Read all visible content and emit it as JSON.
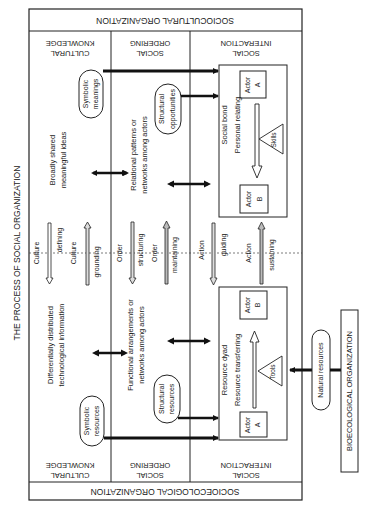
{
  "title": "THE PROCESS OF SOCIAL ORGANIZATION",
  "bands": {
    "top": "SOCIOCULTURAL ORGANIZATION",
    "bottom": "SOCIOECOLOGICAL ORGANIZATION",
    "external": "BIOECOLOGICAL ORGANIZATION"
  },
  "columns": [
    {
      "line1": "CULTURAL",
      "line2": "KNOWLEDGE"
    },
    {
      "line1": "SOCIAL",
      "line2": "ORDERING"
    },
    {
      "line1": "SOCIAL",
      "line2": "INTERACTION"
    }
  ],
  "upper_half": {
    "cultural_text": {
      "line1": "Broadly shared",
      "line2": "meaningful ideas"
    },
    "ordering_text": {
      "line1": "Relational patterns or",
      "line2": "networks among actors"
    },
    "symbolic_pill": {
      "line1": "Symbolic",
      "line2": "meanings"
    },
    "structural_pill": {
      "line1": "Structural",
      "line2": "opportunities"
    },
    "box": {
      "line1": "Social bond",
      "line2": "Personal relating",
      "actor_top": {
        "line1": "Actor",
        "line2": "A"
      },
      "actor_bottom": {
        "line1": "Actor",
        "line2": "B"
      },
      "triangle": "Skills"
    }
  },
  "lower_half": {
    "cultural_text": {
      "line1": "Differentially distributed",
      "line2": "technological information"
    },
    "ordering_text": {
      "line1": "Functional arrangements or",
      "line2": "networks among actors"
    },
    "symbolic_pill": {
      "line1": "Symbolic",
      "line2": "resources"
    },
    "structural_pill": {
      "line1": "Structural",
      "line2": "resources"
    },
    "box": {
      "line1": "Resource dyad",
      "line2": "Resource transferring",
      "actor_top": {
        "line1": "Actor",
        "line2": "B"
      },
      "actor_bottom": {
        "line1": "Actor",
        "line2": "A"
      },
      "triangle": "Tools"
    }
  },
  "middle_processes": {
    "culture": {
      "down_label": "Culture",
      "down_verb": "defining",
      "up_label": "Culture",
      "up_verb": "grounding"
    },
    "order": {
      "down_label": "Order",
      "down_verb": "structuring",
      "up_label": "Order",
      "up_verb": "maintaining"
    },
    "action": {
      "down_label": "Action",
      "down_verb": "guiding",
      "up_label": "Action",
      "up_verb": "sustaining"
    }
  },
  "natural_resources": "Natural resources"
}
